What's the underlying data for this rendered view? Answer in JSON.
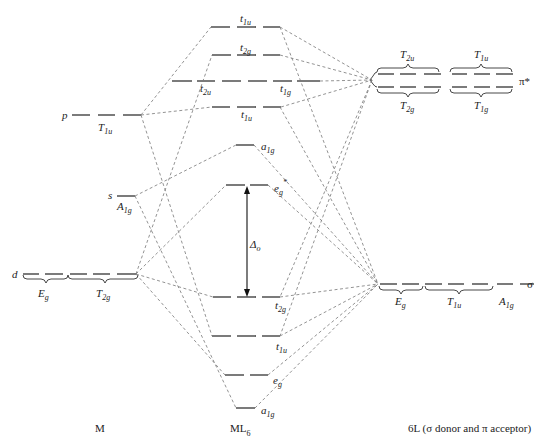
{
  "figure": {
    "type": "molecular-orbital-diagram",
    "columns": {
      "metal": "M",
      "complex": "ML",
      "complex_sub": "6",
      "ligands": "6L (σ donor and π acceptor)"
    },
    "metal_orbitals": [
      {
        "atomic": "p",
        "sym": "T",
        "sym_sub": "1u"
      },
      {
        "atomic": "s",
        "sym": "A",
        "sym_sub": "1g"
      },
      {
        "atomic": "d",
        "sym": "E",
        "sym_sub": "g",
        "sym2": "T",
        "sym2_sub": "2g"
      }
    ],
    "mo_levels": [
      {
        "label": "t",
        "sub": "1u",
        "note": "antibonding"
      },
      {
        "label": "t",
        "sub": "2g",
        "note": "π* antibonding"
      },
      {
        "label": "t",
        "sub": "2u",
        "note": "nonbonding"
      },
      {
        "label": "t",
        "sub": "1g",
        "note": "nonbonding"
      },
      {
        "label": "t",
        "sub": "1u",
        "note": "π"
      },
      {
        "label": "a",
        "sub": "1g",
        "note": "antibonding"
      },
      {
        "label": "e",
        "sub": "g",
        "sup": "*",
        "note": "antibonding"
      },
      {
        "label": "t",
        "sub": "2g",
        "note": "π bonding"
      },
      {
        "label": "t",
        "sub": "1u",
        "note": "bonding"
      },
      {
        "label": "e",
        "sub": "g",
        "note": "bonding"
      },
      {
        "label": "a",
        "sub": "1g",
        "note": "bonding"
      }
    ],
    "ligand_groups": {
      "pi_star": {
        "label": "π*",
        "upper": [
          {
            "sym": "T",
            "sub": "2u"
          },
          {
            "sym": "T",
            "sub": "1u"
          }
        ],
        "lower": [
          {
            "sym": "T",
            "sub": "2g"
          },
          {
            "sym": "T",
            "sub": "1g"
          }
        ]
      },
      "sigma": {
        "label": "σ",
        "lower": [
          {
            "sym": "E",
            "sub": "g"
          },
          {
            "sym": "T",
            "sub": "1u"
          },
          {
            "sym": "A",
            "sub": "1g"
          }
        ]
      }
    },
    "splitting": {
      "symbol": "Δ",
      "sub": "o"
    }
  }
}
